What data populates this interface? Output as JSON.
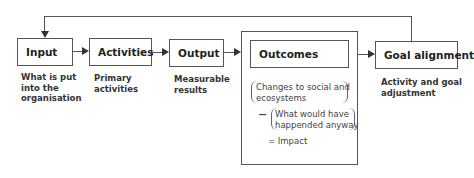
{
  "diagram": {
    "nodes": [
      {
        "id": "input",
        "label": "Input",
        "description": "What is put into the organisation"
      },
      {
        "id": "activities",
        "label": "Activities",
        "description": "Primary activities"
      },
      {
        "id": "output",
        "label": "Output",
        "description": "Measurable results"
      },
      {
        "id": "outcomes",
        "label": "Outcomes"
      },
      {
        "id": "goal",
        "label": "Goal alignment",
        "description": "Activity and goal adjustment"
      }
    ],
    "desc_lines": {
      "input": [
        "What is put",
        "into the",
        "organisation"
      ],
      "activities": [
        "Primary",
        "activities"
      ],
      "output": [
        "Measurable",
        "results"
      ],
      "goal": [
        "Activity and goal",
        "adjustment"
      ]
    },
    "formula": {
      "term1": [
        "Changes to social and",
        "ecosystems"
      ],
      "minus": "−",
      "term2": [
        "What would have",
        "happended anyway"
      ],
      "result": "= Impact"
    },
    "edges": [
      {
        "from": "input",
        "to": "activities"
      },
      {
        "from": "activities",
        "to": "output"
      },
      {
        "from": "output",
        "to": "outcomes"
      },
      {
        "from": "outcomes",
        "to": "goal"
      },
      {
        "from": "goal",
        "to": "input",
        "type": "feedback"
      }
    ]
  }
}
